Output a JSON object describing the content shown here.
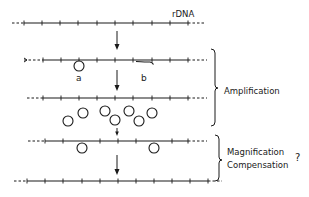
{
  "diagram": {
    "colors": {
      "ink": "#1a1a1a",
      "background": "#ffffff"
    },
    "labels": {
      "rdna": "rDNA",
      "a": "a",
      "b": "b",
      "amplification": "Amplification",
      "magnification": "Magnification",
      "compensation": "Compensation",
      "question": "?"
    },
    "rows": [
      {
        "id": "chromosomal-rdna",
        "y": 23,
        "dash_left": [
          12,
          24
        ],
        "solid": [
          24,
          188
        ],
        "dash_right": [
          188,
          205
        ],
        "ticks": [
          24,
          42,
          60,
          78,
          97,
          115,
          133,
          152,
          170,
          188
        ]
      },
      {
        "id": "excision-step",
        "y": 60,
        "dash_left": [
          24,
          43
        ],
        "solid": [
          43,
          188
        ],
        "dash_right": [
          188,
          207
        ],
        "ticks": [
          43,
          61,
          79,
          97,
          115,
          133,
          152,
          170,
          188
        ]
      },
      {
        "id": "reduced-array",
        "y": 98,
        "dash_left": [
          27,
          43
        ],
        "solid": [
          43,
          188
        ],
        "dash_right": [
          188,
          207
        ],
        "ticks": [
          43,
          61,
          79,
          97,
          115,
          133,
          152,
          170,
          188
        ]
      },
      {
        "id": "reintegration-step",
        "y": 141,
        "dash_left": [
          28,
          45
        ],
        "solid": [
          45,
          188
        ],
        "dash_right": [
          188,
          207
        ],
        "ticks": [
          45,
          63,
          82,
          100,
          118,
          136,
          154,
          172,
          188
        ]
      },
      {
        "id": "restored-array",
        "y": 181,
        "dash_left": [
          14,
          27
        ],
        "solid": [
          27,
          208
        ],
        "dash_right": [
          208,
          222
        ],
        "ticks": [
          27,
          45,
          63,
          82,
          100,
          118,
          136,
          154,
          172,
          190,
          208
        ]
      }
    ],
    "arrows": [
      {
        "x": 117,
        "y1": 31,
        "y2": 50
      },
      {
        "x": 117,
        "y1": 70,
        "y2": 91
      },
      {
        "x": 117,
        "y1": 128,
        "y2": 136
      },
      {
        "x": 117,
        "y1": 155,
        "y2": 175
      }
    ],
    "circles": {
      "excised_a": {
        "x": 79,
        "y": 66,
        "r": 5
      },
      "extrachromosomal": [
        {
          "x": 68,
          "y": 121
        },
        {
          "x": 83,
          "y": 113
        },
        {
          "x": 105,
          "y": 111
        },
        {
          "x": 115,
          "y": 120
        },
        {
          "x": 129,
          "y": 111
        },
        {
          "x": 139,
          "y": 121
        },
        {
          "x": 152,
          "y": 113
        }
      ],
      "reintegrating": [
        {
          "x": 82,
          "y": 149
        },
        {
          "x": 154,
          "y": 149
        }
      ],
      "radius": 5
    },
    "braces": [
      {
        "label": "Amplification",
        "x": 216,
        "y_top": 49,
        "y_bottom": 126,
        "y_point": 88
      },
      {
        "label": "Magnification Compensation",
        "x": 220,
        "y_top": 135,
        "y_bottom": 181,
        "y_point": 160
      }
    ]
  }
}
